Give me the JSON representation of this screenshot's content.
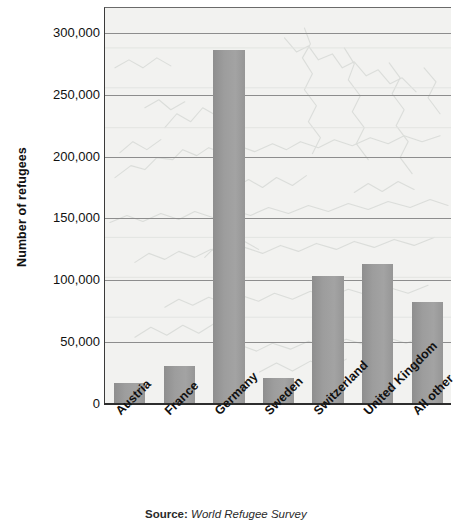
{
  "chart_data": {
    "type": "bar",
    "title": "",
    "xlabel": "",
    "ylabel": "Number of refugees",
    "categories": [
      "Austria",
      "France",
      "Germany",
      "Sweden",
      "Switzerland",
      "United Kingdom",
      "All other"
    ],
    "values": [
      16000,
      30000,
      285000,
      20000,
      103000,
      112000,
      82000
    ],
    "ylim": [
      0,
      320000
    ],
    "yticks": [
      0,
      50000,
      100000,
      150000,
      200000,
      250000,
      300000
    ],
    "ytick_labels": [
      "0",
      "50,000",
      "100,000",
      "150,000",
      "200,000",
      "250,000",
      "300,000"
    ],
    "grid": true,
    "gridlines_at": [
      50000,
      100000,
      150000,
      200000,
      250000,
      300000
    ],
    "legend": "none",
    "bar_color": "#9a9a9a",
    "plot_background": "#f2f2f0",
    "background_image": "europe-map-watermark",
    "axis_color": "#2d2d2d",
    "xtick_rotation": -45
  },
  "source": {
    "label": "Source:",
    "value": "World Refugee Survey"
  }
}
